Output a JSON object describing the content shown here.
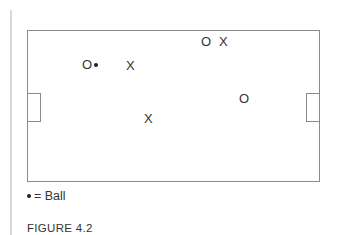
{
  "diagram": {
    "markers": [
      {
        "id": "o1",
        "symbol": "O",
        "x": 82,
        "y": 58
      },
      {
        "id": "x1",
        "symbol": "X",
        "x": 126,
        "y": 59
      },
      {
        "id": "o2",
        "symbol": "O",
        "x": 201,
        "y": 35
      },
      {
        "id": "x2",
        "symbol": "X",
        "x": 219,
        "y": 35
      },
      {
        "id": "o3",
        "symbol": "O",
        "x": 239,
        "y": 92
      },
      {
        "id": "x3",
        "symbol": "X",
        "x": 144,
        "y": 112
      }
    ],
    "ball": {
      "x": 94,
      "y": 63
    }
  },
  "legend": {
    "text": "= Ball"
  },
  "caption": "FIGURE 4.2"
}
